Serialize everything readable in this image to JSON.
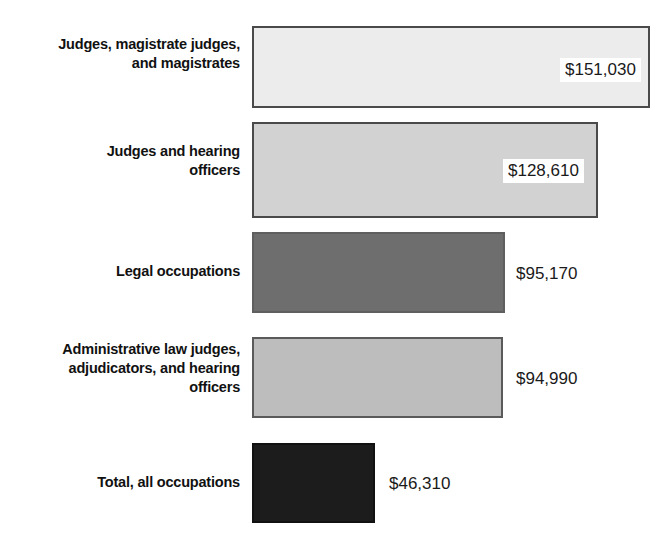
{
  "chart_data": {
    "type": "bar",
    "orientation": "horizontal",
    "title": "",
    "subtitle": "",
    "xlabel": "",
    "ylabel": "",
    "grid": false,
    "legend": "none",
    "axis_visible": false,
    "xlim": [
      0,
      160000
    ],
    "value_prefix": "$",
    "categories": [
      "Judges, magistrate judges, and magistrates",
      "Judges and hearing officers",
      "Legal occupations",
      "Administrative law judges, adjudicators, and hearing officers",
      "Total, all occupations"
    ],
    "values": [
      151030,
      128610,
      95170,
      94990,
      46310
    ],
    "value_labels": [
      "$151,030",
      "$128,610",
      "$95,170",
      "$94,990",
      "$46,310"
    ],
    "bar_colors": [
      "#ececec",
      "#d2d2d2",
      "#6e6e6e",
      "#bdbdbd",
      "#1c1c1c"
    ],
    "bar_border_colors": [
      "#4a4a4a",
      "#4a4a4a",
      "#4a4a4a",
      "#5a5a5a",
      "#111111"
    ]
  },
  "bars": [
    {
      "label_lines": [
        "Judges, magistrate judges,",
        "and magistrates"
      ],
      "value_label": "$151,030",
      "value": 151030,
      "fill": "#ececec",
      "border": "#4a4a4a",
      "label_placement": "inside-right",
      "geom": {
        "top": 26,
        "height": 82,
        "left": 252,
        "width": 398,
        "label_top": 35
      },
      "value_geom": {
        "left": 560,
        "top": 58
      }
    },
    {
      "label_lines": [
        "Judges and hearing",
        "officers"
      ],
      "value_label": "$128,610",
      "value": 128610,
      "fill": "#d2d2d2",
      "border": "#4a4a4a",
      "label_placement": "inside-right",
      "geom": {
        "top": 122,
        "height": 96,
        "left": 252,
        "width": 346,
        "label_top": 142
      },
      "value_geom": {
        "left": 503,
        "top": 159
      }
    },
    {
      "label_lines": [
        "Legal occupations"
      ],
      "value_label": "$95,170",
      "value": 95170,
      "fill": "#6e6e6e",
      "border": "#5f5f5f",
      "label_placement": "outside",
      "geom": {
        "top": 232,
        "height": 81,
        "left": 252,
        "width": 253,
        "label_top": 262
      },
      "value_geom": {
        "left": 508,
        "top": 262
      }
    },
    {
      "label_lines": [
        "Administrative law judges,",
        "adjudicators, and hearing",
        "officers"
      ],
      "value_label": "$94,990",
      "value": 94990,
      "fill": "#bdbdbd",
      "border": "#5a5a5a",
      "label_placement": "outside",
      "geom": {
        "top": 337,
        "height": 81,
        "left": 252,
        "width": 251,
        "label_top": 340
      },
      "value_geom": {
        "left": 508,
        "top": 367
      }
    },
    {
      "label_lines": [
        "Total, all occupations"
      ],
      "value_label": "$46,310",
      "value": 46310,
      "fill": "#1c1c1c",
      "border": "#111111",
      "label_placement": "outside",
      "geom": {
        "top": 443,
        "height": 80,
        "left": 252,
        "width": 123,
        "label_top": 473
      },
      "value_geom": {
        "left": 381,
        "top": 472
      }
    }
  ]
}
